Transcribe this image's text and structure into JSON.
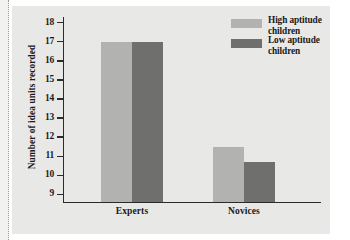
{
  "chart_data": {
    "type": "bar",
    "title": "",
    "subtitle": "",
    "xlabel": "",
    "ylabel": "Number of idea units recorded",
    "categories": [
      "Experts",
      "Novices"
    ],
    "series": [
      {
        "name": "High aptitude children",
        "color": "#b2b2b0",
        "values": [
          17.0,
          11.5
        ]
      },
      {
        "name": "Low aptitude children",
        "color": "#6f6f6d",
        "values": [
          17.0,
          10.7
        ]
      }
    ],
    "ylim": [
      8.6,
      18.3
    ],
    "yticks": [
      9,
      10,
      11,
      12,
      13,
      14,
      15,
      16,
      17,
      18
    ],
    "ytick_labels": [
      "9",
      "10",
      "11",
      "12",
      "13",
      "14",
      "15",
      "16",
      "17",
      "18"
    ],
    "grid": false,
    "legend_position": "top-right",
    "axis_color": "#2b2b2b",
    "panel_background": "#e8e8e6"
  },
  "legend": {
    "entries": [
      {
        "label_line1": "High aptitude",
        "label_line2": "children",
        "color": "#b2b2b0"
      },
      {
        "label_line1": "Low aptitude",
        "label_line2": "children",
        "color": "#6f6f6d"
      }
    ]
  },
  "axes": {
    "y_title": "Number of idea units recorded",
    "ticks": [
      {
        "value": 18,
        "label": "18"
      },
      {
        "value": 17,
        "label": "17"
      },
      {
        "value": 16,
        "label": "16"
      },
      {
        "value": 15,
        "label": "15"
      },
      {
        "value": 14,
        "label": "14"
      },
      {
        "value": 13,
        "label": "13"
      },
      {
        "value": 12,
        "label": "12"
      },
      {
        "value": 11,
        "label": "11"
      },
      {
        "value": 10,
        "label": "10"
      },
      {
        "value": 9,
        "label": "9"
      }
    ],
    "category_labels": [
      {
        "label": "Experts"
      },
      {
        "label": "Novices"
      }
    ]
  }
}
